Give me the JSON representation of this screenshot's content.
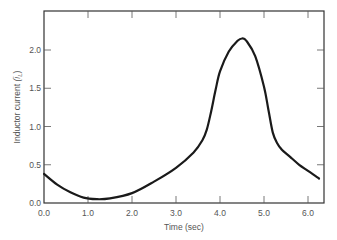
{
  "chart_data": {
    "type": "line",
    "title": "",
    "xlabel": "Time (sec)",
    "ylabel": "Inductor current (i_L)",
    "ylabel_main": "Inductor current ",
    "ylabel_var": "(i",
    "ylabel_sub": "L",
    "ylabel_close": ")",
    "xlim": [
      0.0,
      6.35
    ],
    "ylim": [
      0.0,
      2.5
    ],
    "x_ticks": [
      "0.0",
      "1.0",
      "2.0",
      "3.0",
      "4.0",
      "5.0",
      "6.0"
    ],
    "y_ticks": [
      "0.0",
      "0.5",
      "1.0",
      "1.5",
      "2.0"
    ],
    "grid": false,
    "legend": null,
    "series": [
      {
        "name": "Inductor current",
        "color": "#1a1a1a",
        "x": [
          0.0,
          0.3,
          0.6,
          0.9,
          1.2,
          1.5,
          2.0,
          2.5,
          3.0,
          3.4,
          3.6,
          3.7,
          3.8,
          3.9,
          4.0,
          4.2,
          4.4,
          4.5,
          4.6,
          4.8,
          5.0,
          5.1,
          5.2,
          5.3,
          5.4,
          5.6,
          5.8,
          6.0,
          6.25
        ],
        "values": [
          0.38,
          0.24,
          0.14,
          0.07,
          0.05,
          0.06,
          0.13,
          0.28,
          0.46,
          0.66,
          0.82,
          0.96,
          1.2,
          1.48,
          1.72,
          1.98,
          2.12,
          2.15,
          2.12,
          1.92,
          1.52,
          1.22,
          0.92,
          0.78,
          0.7,
          0.6,
          0.5,
          0.42,
          0.32
        ]
      }
    ]
  }
}
